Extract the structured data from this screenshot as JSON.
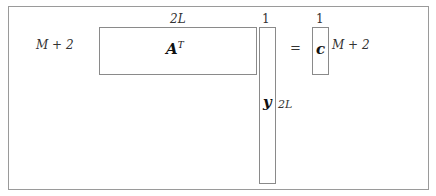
{
  "diagram": {
    "type": "matrix-dimension-diagram",
    "equation": "A^T y = c",
    "matrix_A_T": {
      "symbol": "A",
      "superscript": "T",
      "rows_label": "M + 2",
      "cols_label": "2L"
    },
    "vector_y": {
      "symbol": "y",
      "cols_label": "1",
      "rows_label": "2L"
    },
    "equals": "=",
    "vector_c": {
      "symbol": "c",
      "cols_label": "1",
      "rows_label": "M + 2"
    }
  }
}
